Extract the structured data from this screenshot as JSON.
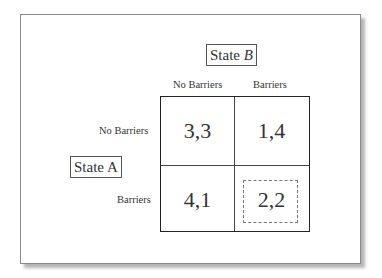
{
  "figure": {
    "type": "payoff-matrix",
    "player_b": {
      "label_prefix": "State ",
      "label_var": "B"
    },
    "player_a": {
      "label_prefix": "State ",
      "label_var": "A"
    },
    "columns": [
      "No Barriers",
      "Barriers"
    ],
    "rows": [
      "No Barriers",
      "Barriers"
    ],
    "payoffs": [
      [
        "3,3",
        "1,4"
      ],
      [
        "4,1",
        "2,2"
      ]
    ],
    "highlighted_cell": {
      "row": 1,
      "col": 1,
      "style": "dashed-box"
    }
  }
}
